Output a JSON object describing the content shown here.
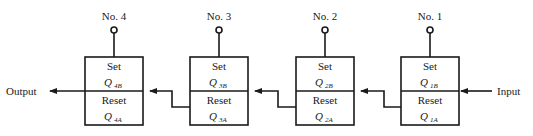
{
  "diagram": {
    "input_label": "Input",
    "output_label": "Output",
    "stages": [
      {
        "name": "No. 4",
        "set": "Set",
        "reset": "Reset",
        "set_q": "Q",
        "set_sub": "4B",
        "reset_q": "Q",
        "reset_sub": "4A"
      },
      {
        "name": "No. 3",
        "set": "Set",
        "reset": "Reset",
        "set_q": "Q",
        "set_sub": "3B",
        "reset_q": "Q",
        "reset_sub": "3A"
      },
      {
        "name": "No. 2",
        "set": "Set",
        "reset": "Reset",
        "set_q": "Q",
        "set_sub": "2B",
        "reset_q": "Q",
        "reset_sub": "2A"
      },
      {
        "name": "No. 1",
        "set": "Set",
        "reset": "Reset",
        "set_q": "Q",
        "set_sub": "1B",
        "reset_q": "Q",
        "reset_sub": "1A"
      }
    ]
  }
}
